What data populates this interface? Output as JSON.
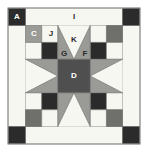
{
  "diagram": {
    "type": "quilt-block",
    "canvas": {
      "width": 148,
      "height": 152
    },
    "colors": {
      "background": "#ffffff",
      "white_fabric": "#f7f7f2",
      "light_gray_fabric": "#e8e8e3",
      "medium_gray_fabric": "#9a9a97",
      "dark_gray_fabric": "#4f4f4f",
      "black_fabric": "#2b2b2b",
      "outline": "#6b6b6b",
      "label_on_dark": "#ffffff",
      "label_on_light": "#2b2b2b"
    },
    "labels": [
      {
        "id": "A",
        "text": "A",
        "x": 17,
        "y": 17,
        "tone": "dark",
        "piece": "corner-black-square"
      },
      {
        "id": "I",
        "text": "I",
        "x": 74,
        "y": 17,
        "tone": "light",
        "piece": "top-border-strip"
      },
      {
        "id": "C",
        "text": "C",
        "x": 37,
        "y": 34,
        "tone": "dark",
        "piece": "checker-medium-square"
      },
      {
        "id": "J",
        "text": "J",
        "x": 55,
        "y": 34,
        "tone": "light",
        "piece": "checker-white-square"
      },
      {
        "id": "K",
        "text": "K",
        "x": 76,
        "y": 41,
        "tone": "light",
        "piece": "geese-center-white-triangle"
      },
      {
        "id": "G",
        "text": "G",
        "x": 65,
        "y": 54,
        "tone": "light",
        "piece": "geese-left-gray-triangle"
      },
      {
        "id": "F",
        "text": "F",
        "x": 88,
        "y": 54,
        "tone": "light",
        "piece": "geese-right-gray-triangle"
      },
      {
        "id": "D",
        "text": "D",
        "x": 76,
        "y": 77,
        "tone": "dark",
        "piece": "center-square"
      }
    ],
    "pieces": {
      "outer_frame": "thin gray outline around whole block",
      "border": "white border strip with black corner squares",
      "star": "sawtooth star: dark gray center with medium gray points",
      "corner_units": "four-patch checkerboards of medium gray and white",
      "geese": "flying geese units on each side of the star"
    }
  }
}
